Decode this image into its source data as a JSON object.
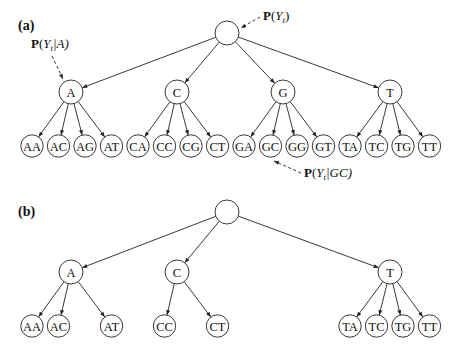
{
  "panels": [
    {
      "label": "(a)",
      "root": {
        "x": 227,
        "y": 33,
        "r": 12,
        "label": ""
      },
      "mid_nodes": [
        {
          "id": "A",
          "label": "A",
          "x": 71,
          "y": 92
        },
        {
          "id": "C",
          "label": "C",
          "x": 177,
          "y": 92
        },
        {
          "id": "G",
          "label": "G",
          "x": 283,
          "y": 92
        },
        {
          "id": "T",
          "label": "T",
          "x": 390,
          "y": 92
        }
      ],
      "leaves": [
        {
          "label": "AA",
          "parent": "A",
          "x": 32
        },
        {
          "label": "AC",
          "parent": "A",
          "x": 58.5
        },
        {
          "label": "AG",
          "parent": "A",
          "x": 85
        },
        {
          "label": "AT",
          "parent": "A",
          "x": 111.5
        },
        {
          "label": "CA",
          "parent": "C",
          "x": 138
        },
        {
          "label": "CC",
          "parent": "C",
          "x": 164.5
        },
        {
          "label": "CG",
          "parent": "C",
          "x": 191
        },
        {
          "label": "CT",
          "parent": "C",
          "x": 217.5
        },
        {
          "label": "GA",
          "parent": "G",
          "x": 244
        },
        {
          "label": "GC",
          "parent": "G",
          "x": 270.5
        },
        {
          "label": "GG",
          "parent": "G",
          "x": 297
        },
        {
          "label": "GT",
          "parent": "G",
          "x": 323.5
        },
        {
          "label": "TA",
          "parent": "T",
          "x": 350
        },
        {
          "label": "TC",
          "parent": "T",
          "x": 376.5
        },
        {
          "label": "TG",
          "parent": "T",
          "x": 403
        },
        {
          "label": "TT",
          "parent": "T",
          "x": 429.5
        }
      ],
      "leaf_y": 146,
      "annotations": [
        {
          "text_bold": "P",
          "text_rest": "(Y",
          "sub": "t",
          "tail": ")",
          "x": 263,
          "y": 20,
          "target": "root"
        },
        {
          "text_bold": "P",
          "text_rest": "(Y",
          "sub": "t",
          "tail": "|A)",
          "x": 31,
          "y": 48,
          "target": "A"
        },
        {
          "text_bold": "P",
          "text_rest": "(Y",
          "sub": "t",
          "tail": "|GC)",
          "x": 304,
          "y": 177,
          "target": "GC"
        }
      ]
    },
    {
      "label": "(b)",
      "root": {
        "x": 227,
        "y": 212,
        "r": 12,
        "label": ""
      },
      "mid_nodes": [
        {
          "id": "A",
          "label": "A",
          "x": 71,
          "y": 272
        },
        {
          "id": "C",
          "label": "C",
          "x": 177,
          "y": 272
        },
        {
          "id": "T",
          "label": "T",
          "x": 390,
          "y": 272
        }
      ],
      "leaves": [
        {
          "label": "AA",
          "parent": "A",
          "x": 32
        },
        {
          "label": "AC",
          "parent": "A",
          "x": 58.5
        },
        {
          "label": "AT",
          "parent": "A",
          "x": 111.5
        },
        {
          "label": "CC",
          "parent": "C",
          "x": 164.5
        },
        {
          "label": "CT",
          "parent": "C",
          "x": 217.5
        },
        {
          "label": "TA",
          "parent": "T",
          "x": 350
        },
        {
          "label": "TC",
          "parent": "T",
          "x": 376.5
        },
        {
          "label": "TG",
          "parent": "T",
          "x": 403
        },
        {
          "label": "TT",
          "parent": "T",
          "x": 429.5
        }
      ],
      "leaf_y": 326
    }
  ]
}
